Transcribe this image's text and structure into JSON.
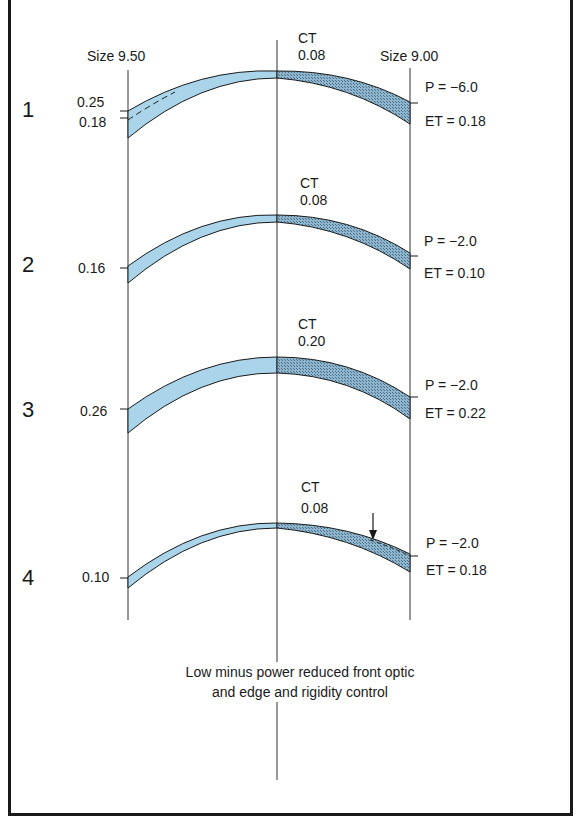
{
  "header": {
    "left_size": "Size 9.50",
    "right_size": "Size 9.00"
  },
  "lenses": [
    {
      "number": "1",
      "ct_label": "CT",
      "ct_value": "0.08",
      "left_edge_labels": [
        "0.25",
        "0.18"
      ],
      "power": "P = −6.0",
      "edge_thickness": "ET = 0.18"
    },
    {
      "number": "2",
      "ct_label": "CT",
      "ct_value": "0.08",
      "left_edge_labels": [
        "0.16"
      ],
      "power": "P = −2.0",
      "edge_thickness": "ET = 0.10"
    },
    {
      "number": "3",
      "ct_label": "CT",
      "ct_value": "0.20",
      "left_edge_labels": [
        "0.26"
      ],
      "power": "P = −2.0",
      "edge_thickness": "ET = 0.22"
    },
    {
      "number": "4",
      "ct_label": "CT",
      "ct_value": "0.08",
      "left_edge_labels": [
        "0.10"
      ],
      "power": "P = −2.0",
      "edge_thickness": "ET = 0.18"
    }
  ],
  "caption": {
    "line1": "Low minus power reduced front optic",
    "line2": "and edge and rigidity control"
  },
  "colors": {
    "lens_fill": "#a9d4ea",
    "lens_fill_dark": "#7fa9c4",
    "outline": "#1a1a1a"
  }
}
